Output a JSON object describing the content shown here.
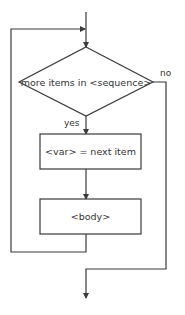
{
  "diagram": {
    "type": "flowchart",
    "colors": {
      "line": "#3a3a3a",
      "text": "#333333",
      "background": "#ffffff"
    },
    "nodes": [
      {
        "id": "condition",
        "shape": "diamond",
        "label": "more items in <sequence>"
      },
      {
        "id": "assign",
        "shape": "rectangle",
        "label": "<var> = next item"
      },
      {
        "id": "body",
        "shape": "rectangle",
        "label": "<body>"
      }
    ],
    "edge_labels": {
      "yes": "yes",
      "no": "no"
    },
    "edges": [
      {
        "from": "entry",
        "to": "condition"
      },
      {
        "from": "condition",
        "to": "assign",
        "label": "yes"
      },
      {
        "from": "assign",
        "to": "body"
      },
      {
        "from": "body",
        "to": "condition",
        "kind": "loop-back"
      },
      {
        "from": "condition",
        "to": "exit",
        "label": "no"
      }
    ]
  }
}
